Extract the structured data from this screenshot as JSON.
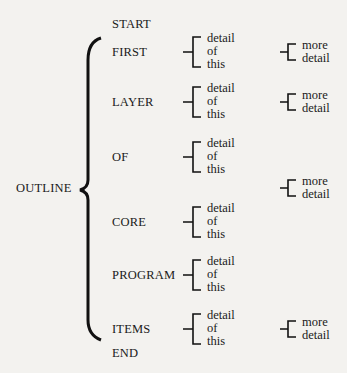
{
  "outline": {
    "root": "OUTLINE",
    "start": "START",
    "end": "END",
    "layers": [
      {
        "label": "FIRST",
        "detail": [
          "detail",
          "of",
          "this"
        ],
        "more": [
          "more",
          "detail"
        ]
      },
      {
        "label": "LAYER",
        "detail": [
          "detail",
          "of",
          "this"
        ],
        "more": [
          "more",
          "detail"
        ]
      },
      {
        "label": "OF",
        "detail": [
          "detail",
          "of",
          "this"
        ],
        "more": null
      },
      {
        "label": "",
        "detail": null,
        "more": [
          "more",
          "detail"
        ]
      },
      {
        "label": "CORE",
        "detail": [
          "detail",
          "of",
          "this"
        ],
        "more": null
      },
      {
        "label": "PROGRAM",
        "detail": [
          "detail",
          "of",
          "this"
        ],
        "more": null
      },
      {
        "label": "ITEMS",
        "detail": [
          "detail",
          "of",
          "this"
        ],
        "more": [
          "more",
          "detail"
        ]
      }
    ]
  }
}
